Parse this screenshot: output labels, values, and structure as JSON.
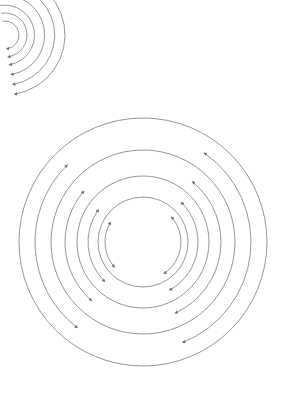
{
  "diagram": {
    "title": "",
    "stroke_color": "#8a8a8a",
    "background": "#ffffff",
    "main_cluster": {
      "center": [
        143,
        242
      ],
      "full_circles_radii": [
        45,
        66,
        92,
        124
      ],
      "arrow_arcs": [
        {
          "side": "left",
          "r": 38,
          "from_deg": 220,
          "to_deg": 150
        },
        {
          "side": "left",
          "r": 55,
          "from_deg": 225,
          "to_deg": 145
        },
        {
          "side": "left",
          "r": 78,
          "from_deg": 228,
          "to_deg": 140
        },
        {
          "side": "left",
          "r": 108,
          "from_deg": 232,
          "to_deg": 135
        },
        {
          "side": "right",
          "r": 38,
          "from_deg": 305,
          "to_deg": 40
        },
        {
          "side": "right",
          "r": 55,
          "from_deg": 300,
          "to_deg": 45
        },
        {
          "side": "right",
          "r": 78,
          "from_deg": 295,
          "to_deg": 50
        },
        {
          "side": "right",
          "r": 108,
          "from_deg": 292,
          "to_deg": 55
        }
      ]
    },
    "corner_cluster": {
      "center": [
        5,
        35
      ],
      "arc_radii": [
        14,
        22,
        30,
        40,
        50,
        60
      ],
      "arrow_at": "lower-end"
    }
  }
}
